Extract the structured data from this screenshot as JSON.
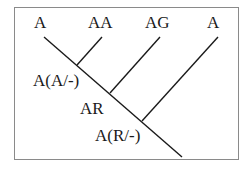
{
  "diagram": {
    "type": "cladogram",
    "leaves": [
      {
        "label": "A"
      },
      {
        "label": "AA"
      },
      {
        "label": "AG"
      },
      {
        "label": "A"
      }
    ],
    "nodes": [
      {
        "label": "A(A/-)"
      },
      {
        "label": "AR"
      },
      {
        "label": "A(R/-)"
      }
    ],
    "colors": {
      "line": "#1a1a1a",
      "border": "#8a8a8a",
      "background": "#ffffff"
    }
  }
}
